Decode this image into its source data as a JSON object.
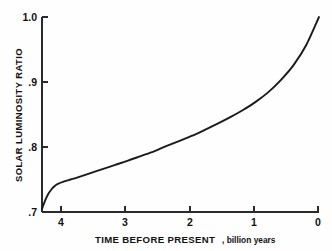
{
  "chart_data": {
    "type": "line",
    "title": "",
    "xlabel_main": "TIME BEFORE PRESENT",
    "xlabel_sub": ", billion years",
    "ylabel": "SOLAR LUMINOSITY RATIO",
    "xlim": [
      4.35,
      0
    ],
    "ylim": [
      0.7,
      1.0
    ],
    "x_ticks": [
      4,
      3,
      2,
      1,
      0
    ],
    "x_tick_labels": [
      "4",
      "3",
      "2",
      "1",
      "0"
    ],
    "y_ticks": [
      0.7,
      0.8,
      0.9,
      1.0
    ],
    "y_tick_labels": [
      ".7",
      ".8",
      ".9",
      "1.0"
    ],
    "grid": false,
    "legend": "none",
    "x_axis_direction": "decreasing",
    "series": [
      {
        "name": "Solar luminosity ratio vs time before present",
        "color": "#1a1a1a",
        "x": [
          4.35,
          4.3,
          4.25,
          4.2,
          4.15,
          4.1,
          4.0,
          3.9,
          3.8,
          3.6,
          3.4,
          3.2,
          3.0,
          2.8,
          2.6,
          2.5,
          2.4,
          2.2,
          2.0,
          1.8,
          1.6,
          1.4,
          1.2,
          1.0,
          0.8,
          0.6,
          0.4,
          0.2,
          0.0
        ],
        "y": [
          0.705,
          0.718,
          0.728,
          0.735,
          0.74,
          0.7432,
          0.747,
          0.75,
          0.753,
          0.7595,
          0.766,
          0.7725,
          0.779,
          0.786,
          0.793,
          0.797,
          0.8012,
          0.809,
          0.817,
          0.826,
          0.8355,
          0.8455,
          0.8565,
          0.869,
          0.884,
          0.903,
          0.926,
          0.957,
          1.0
        ]
      }
    ],
    "annotations": []
  },
  "figure": {
    "background_color": "#ffffff",
    "axis_color": "#2a2a2a",
    "curve_color": "#1a1a1a"
  }
}
